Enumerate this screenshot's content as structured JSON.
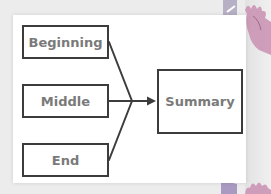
{
  "diagram": {
    "type": "flow",
    "nodes": [
      {
        "id": "beginning",
        "label": "Beginning"
      },
      {
        "id": "middle",
        "label": "Middle"
      },
      {
        "id": "end",
        "label": "End"
      },
      {
        "id": "summary",
        "label": "Summary"
      }
    ],
    "edges": [
      {
        "from": "beginning",
        "to": "summary"
      },
      {
        "from": "middle",
        "to": "summary"
      },
      {
        "from": "end",
        "to": "summary"
      }
    ]
  },
  "colors": {
    "box_border": "#3c3c3c",
    "box_text": "#7a7a7a",
    "card_bg": "#ffffff",
    "page_bg": "#ececec",
    "decoration_pink": "#c98fb0",
    "decoration_purple": "#9a86b8"
  },
  "decorations": {
    "top_right": "flower-sticker-icon",
    "bottom_right": "flower-sticker-icon"
  }
}
